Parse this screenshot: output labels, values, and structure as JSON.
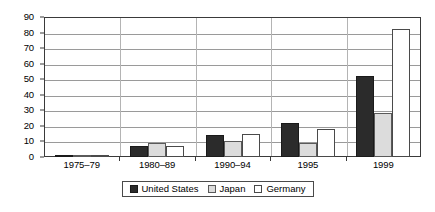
{
  "chart_data": {
    "type": "bar",
    "title": "",
    "subtitle": "",
    "xlabel": "",
    "ylabel": "",
    "categories": [
      "1975–79",
      "1980–89",
      "1990–94",
      "1995",
      "1999"
    ],
    "series": [
      {
        "name": "United States",
        "color": "#2b2b2b",
        "values": [
          1.2,
          7,
          14,
          22,
          52
        ]
      },
      {
        "name": "Japan",
        "color": "#dcdcdc",
        "values": [
          0.8,
          9,
          10,
          9,
          28
        ]
      },
      {
        "name": "Germany",
        "color": "#ffffff",
        "values": [
          1.2,
          7,
          15,
          18,
          82
        ]
      }
    ],
    "ylim": [
      0,
      90
    ],
    "ytick_step": 10,
    "yticks": [
      "0",
      "10",
      "20",
      "30",
      "40",
      "50",
      "60",
      "70",
      "80",
      "90"
    ],
    "grid": "horizontal",
    "legend_position": "bottom",
    "legend_entries": [
      "United States",
      "Japan",
      "Germany"
    ]
  },
  "legend": {
    "items": [
      {
        "label": "United States",
        "swatch": "legend-swatch-united-states"
      },
      {
        "label": "Japan",
        "swatch": "legend-swatch-japan"
      },
      {
        "label": "Germany",
        "swatch": "legend-swatch-germany"
      }
    ]
  }
}
